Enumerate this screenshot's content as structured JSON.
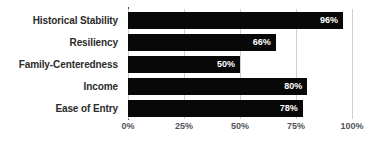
{
  "chart_data": {
    "type": "bar",
    "orientation": "horizontal",
    "title": "",
    "subtitle": "",
    "xlabel": "",
    "ylabel": "",
    "categories": [
      "Historical Stability",
      "Resiliency",
      "Family-Centeredness",
      "Income",
      "Ease of Entry"
    ],
    "values": [
      96,
      66,
      50,
      80,
      78
    ],
    "value_labels": [
      "96%",
      "66%",
      "50%",
      "80%",
      "78%"
    ],
    "xlim": [
      0,
      100
    ],
    "xticks": [
      0,
      25,
      50,
      75,
      100
    ],
    "xtick_labels": [
      "0%",
      "25%",
      "50%",
      "75%",
      "100%"
    ],
    "grid": true,
    "grid_axis": "x",
    "legend": false,
    "legend_position": "none",
    "colors": {
      "bar": "#080808",
      "value_label": "#ffffff",
      "category_label": "#2b2b2b",
      "tick_label": "#54545a",
      "gridline": "#cfcfcf",
      "axis_line": "#4a4a4a",
      "background": "#ffffff"
    }
  }
}
